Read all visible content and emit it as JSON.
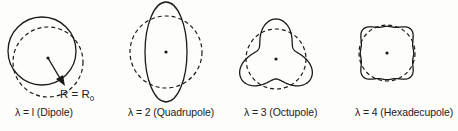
{
  "figure": {
    "panels": [
      {
        "id": "dipole",
        "label": "λ = l (Dipole)",
        "lambda": 1,
        "cx": 48,
        "cy": 60,
        "r0": 35
      },
      {
        "id": "quadrupole",
        "label": "λ = 2 (Quadrupole)",
        "lambda": 2,
        "cx": 166,
        "cy": 52,
        "r0": 36
      },
      {
        "id": "octupole",
        "label": "λ = 3 (Octupole)",
        "lambda": 3,
        "cx": 276,
        "cy": 59,
        "r0": 30
      },
      {
        "id": "hexadecupole",
        "label": "λ = 4 (Hexadecupole)",
        "lambda": 4,
        "cx": 387,
        "cy": 53,
        "r0": 28
      }
    ],
    "radius_annotation": {
      "text": "R = R",
      "subscript": "0"
    },
    "colors": {
      "line": "#1a1a1a",
      "background": "#fdfdfc"
    }
  }
}
